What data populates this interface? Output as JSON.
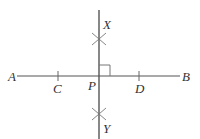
{
  "diagram": {
    "line_color": "#555555",
    "label_color": "#333333",
    "points": {
      "A": "A",
      "B": "B",
      "C": "C",
      "D": "D",
      "P": "P",
      "X": "X",
      "Y": "Y"
    },
    "segments": [
      {
        "from": "A",
        "to": "B",
        "name": "line-ab"
      },
      {
        "from": "X",
        "to": "Y",
        "name": "perpendicular-line",
        "passes_through": "P"
      }
    ],
    "marks": {
      "right_angle_at": "P",
      "tick_marks_at": [
        "C",
        "D"
      ],
      "arc_intersections_at": [
        "X",
        "Y"
      ]
    }
  }
}
